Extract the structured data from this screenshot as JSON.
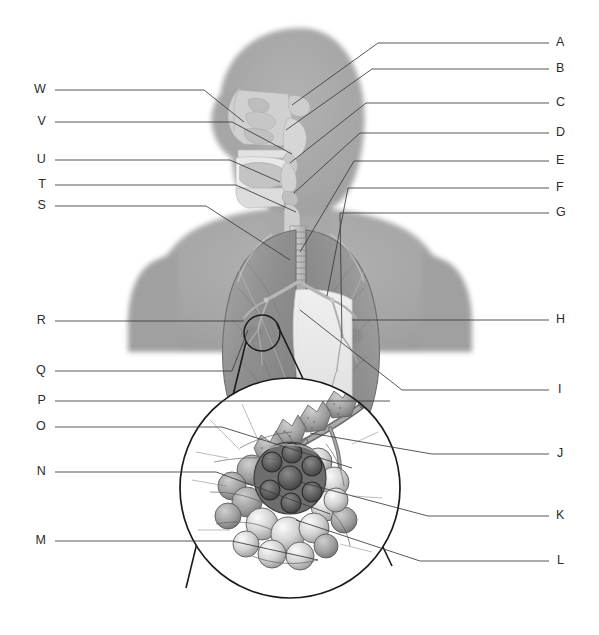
{
  "figure": {
    "background_color": "#ffffff",
    "line_color": "#3a3a3a",
    "label_color": "#2b2b2b",
    "silhouette_color": "#a3a3a3",
    "organ_color": "#9a9a9a"
  },
  "labels_right_upper": [
    {
      "id": "A",
      "text": "A",
      "x": 561,
      "y": 43,
      "leader_y": 43,
      "target_x": 345,
      "target_y": 57
    },
    {
      "id": "B",
      "text": "B",
      "x": 561,
      "y": 69,
      "leader_y": 69,
      "target_x": 341,
      "target_y": 88
    },
    {
      "id": "C",
      "text": "C",
      "x": 561,
      "y": 103,
      "leader_y": 103,
      "target_x": 329,
      "target_y": 123
    },
    {
      "id": "D",
      "text": "D",
      "x": 561,
      "y": 133,
      "leader_y": 133,
      "target_x": 323,
      "target_y": 152
    },
    {
      "id": "E",
      "text": "E",
      "x": 561,
      "y": 161,
      "leader_y": 161,
      "target_x": 318,
      "target_y": 180
    },
    {
      "id": "F",
      "text": "F",
      "x": 561,
      "y": 188,
      "leader_y": 188,
      "target_x": 312,
      "target_y": 207
    },
    {
      "id": "G",
      "text": "G",
      "x": 561,
      "y": 213,
      "leader_y": 213,
      "target_x": 303,
      "target_y": 232
    }
  ],
  "labels_right_lower": [
    {
      "id": "H",
      "text": "H",
      "x": 561,
      "y": 320,
      "leader_y": 320,
      "target_x": 385,
      "target_y": 320
    },
    {
      "id": "I",
      "text": "I",
      "x": 561,
      "y": 390,
      "leader_y": 390,
      "target_x": 398,
      "target_y": 390
    },
    {
      "id": "J",
      "text": "J",
      "x": 561,
      "y": 454,
      "leader_y": 454,
      "target_x": 430,
      "target_y": 454
    },
    {
      "id": "K",
      "text": "K",
      "x": 561,
      "y": 516,
      "leader_y": 516,
      "target_x": 425,
      "target_y": 516
    },
    {
      "id": "L",
      "text": "L",
      "x": 561,
      "y": 561,
      "leader_y": 561,
      "target_x": 418,
      "target_y": 561
    }
  ],
  "labels_left_upper": [
    {
      "id": "W",
      "text": "W",
      "x": 38,
      "y": 90,
      "leader_y": 90,
      "target_x": 207,
      "target_y": 90
    },
    {
      "id": "V",
      "text": "V",
      "x": 38,
      "y": 122,
      "leader_y": 122,
      "target_x": 207,
      "target_y": 122
    },
    {
      "id": "U",
      "text": "U",
      "x": 38,
      "y": 160,
      "leader_y": 160,
      "target_x": 207,
      "target_y": 160
    },
    {
      "id": "T",
      "text": "T",
      "x": 38,
      "y": 185,
      "leader_y": 185,
      "target_x": 207,
      "target_y": 185
    },
    {
      "id": "S",
      "text": "S",
      "x": 38,
      "y": 206,
      "leader_y": 206,
      "target_x": 207,
      "target_y": 206
    }
  ],
  "labels_left_lower": [
    {
      "id": "R",
      "text": "R",
      "x": 38,
      "y": 321,
      "leader_y": 321,
      "target_x": 215,
      "target_y": 321
    },
    {
      "id": "Q",
      "text": "Q",
      "x": 38,
      "y": 371,
      "leader_y": 371,
      "target_x": 198,
      "target_y": 371
    },
    {
      "id": "P",
      "text": "P",
      "x": 38,
      "y": 401,
      "leader_y": 401,
      "target_x": 189,
      "target_y": 401
    },
    {
      "id": "O",
      "text": "O",
      "x": 38,
      "y": 427,
      "leader_y": 427,
      "target_x": 186,
      "target_y": 427
    },
    {
      "id": "N",
      "text": "N",
      "x": 38,
      "y": 472,
      "leader_y": 472,
      "target_x": 182,
      "target_y": 472
    },
    {
      "id": "M",
      "text": "M",
      "x": 38,
      "y": 541,
      "leader_y": 541,
      "target_x": 190,
      "target_y": 541
    }
  ],
  "inset": {
    "magnifier_circle": {
      "cx": 262,
      "cy": 333,
      "r": 18
    },
    "detail_circle": {
      "cx": 290,
      "cy": 488,
      "r": 110
    },
    "content": "alveolar sac cluster with capillary network and terminal bronchiole"
  },
  "anatomy": {
    "head": "sagittal section of head and neck",
    "lungs": "anterior view of both lungs with trachea and bronchi",
    "torso": "head, neck and upper thorax silhouette"
  }
}
